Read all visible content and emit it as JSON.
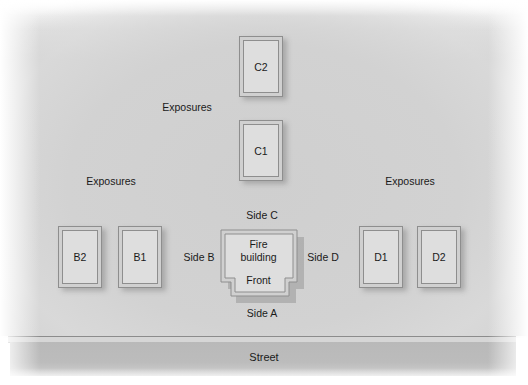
{
  "diagram": {
    "type": "fireground-side-designation",
    "street_label": "Street",
    "fire_building": {
      "label_line1": "Fire",
      "label_line2": "building",
      "front_label": "Front"
    },
    "sides": {
      "a": "Side A",
      "b": "Side B",
      "c": "Side C",
      "d": "Side D"
    },
    "exposure_labels": {
      "top": "Exposures",
      "left": "Exposures",
      "right": "Exposures"
    },
    "exposures": {
      "c2": "C2",
      "c1": "C1",
      "b2": "B2",
      "b1": "B1",
      "d1": "D1",
      "d2": "D2"
    },
    "colors": {
      "ground": "#d2d2d2",
      "street": "#bbbbbb",
      "building_fill": "#dedede",
      "building_outline": "#8e8e8e",
      "text": "#1a1a1a"
    }
  }
}
